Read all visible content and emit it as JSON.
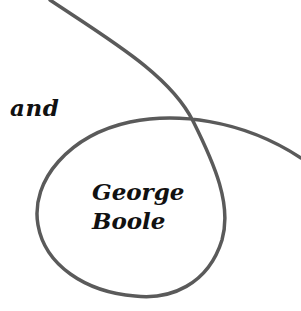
{
  "diagram": {
    "curve_color": "#5a5a5a",
    "curve_stroke_width": 3.5,
    "labels": {
      "outside": "and",
      "inside_line1": "George",
      "inside_line2": "Boole"
    }
  }
}
